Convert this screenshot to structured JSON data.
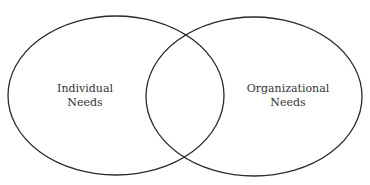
{
  "diagram": {
    "type": "venn",
    "stroke_color": "#2a2a2a",
    "background": "#ffffff",
    "sets": [
      {
        "id": "individual",
        "line1": "Individual",
        "line2": "Needs"
      },
      {
        "id": "organizational",
        "line1": "Organizational",
        "line2": "Needs"
      }
    ]
  }
}
